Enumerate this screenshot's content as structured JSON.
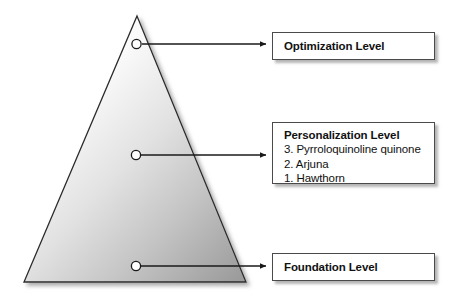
{
  "diagram": {
    "type": "pyramid-callout",
    "shape": {
      "name": "pyramid-triangle",
      "fill_light": "#fbfbfb",
      "fill_dark": "#9a9a9a",
      "stroke": "#2b2b2b"
    },
    "markers": [
      {
        "name": "optimization-marker",
        "label": "Optimization Level"
      },
      {
        "name": "personalization-marker",
        "label": "Personalization Level"
      },
      {
        "name": "foundation-marker",
        "label": "Foundation Level"
      }
    ],
    "callouts": [
      {
        "id": "optimization",
        "title": "Optimization Level",
        "items": []
      },
      {
        "id": "personalization",
        "title": "Personalization Level",
        "items": [
          "3. Pyrroloquinoline quinone",
          "2. Arjuna",
          "1. Hawthorn"
        ]
      },
      {
        "id": "foundation",
        "title": "Foundation Level",
        "items": []
      }
    ]
  }
}
